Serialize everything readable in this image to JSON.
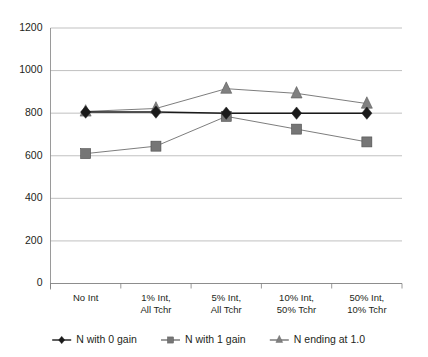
{
  "chart_data": {
    "type": "line",
    "title": "",
    "xlabel": "",
    "ylabel": "",
    "ylim": [
      0,
      1200
    ],
    "ytick_step": 200,
    "grid": true,
    "legend_position": "bottom",
    "categories": [
      "No Int",
      "1% Int,\nAll Tchr",
      "5% Int,\nAll Tchr",
      "10% Int,\n50% Tchr",
      "50% Int,\n10% Tchr"
    ],
    "category_lines": [
      [
        "No Int"
      ],
      [
        "1% Int,",
        "All Tchr"
      ],
      [
        "5% Int,",
        "All Tchr"
      ],
      [
        "10% Int,",
        "50% Tchr"
      ],
      [
        "50% Int,",
        "10% Tchr"
      ]
    ],
    "ytick_labels": [
      "0",
      "200",
      "400",
      "600",
      "800",
      "1000",
      "1200"
    ],
    "ytick_values": [
      0,
      200,
      400,
      600,
      800,
      1000,
      1200
    ],
    "series": [
      {
        "name": "N with 0 gain",
        "marker": "diamond",
        "color": "#1a1a1a",
        "values": [
          805,
          805,
          800,
          800,
          800
        ]
      },
      {
        "name": "N with 1 gain",
        "marker": "square",
        "color": "#767676",
        "values": [
          610,
          645,
          785,
          725,
          665
        ]
      },
      {
        "name": "N ending at 1.0",
        "marker": "triangle",
        "color": "#808080",
        "values": [
          808,
          822,
          915,
          893,
          845
        ]
      }
    ]
  },
  "legend": {
    "items": [
      {
        "label": "N with 0 gain",
        "marker": "diamond"
      },
      {
        "label": "N with 1 gain",
        "marker": "square"
      },
      {
        "label": "N ending at 1.0",
        "marker": "triangle"
      }
    ]
  }
}
